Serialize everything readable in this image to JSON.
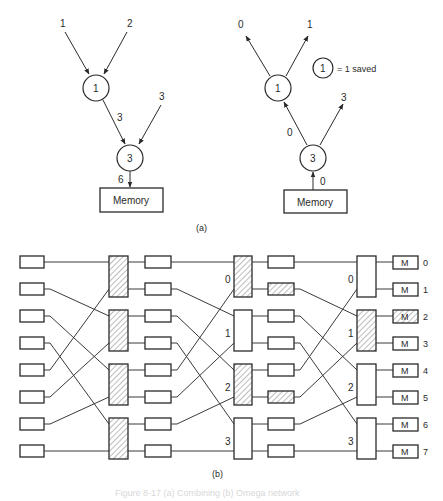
{
  "figure": {
    "part_a": {
      "label": "(a)",
      "combining_tree": {
        "inputs": [
          "1",
          "2"
        ],
        "node_upper": "1",
        "edge_upper_to_lower": "3",
        "side_input": "3",
        "node_lower": "3",
        "to_memory": "6",
        "memory_label": "Memory"
      },
      "decombining_tree": {
        "outputs": [
          "0",
          "1"
        ],
        "node_upper": "1",
        "edge_lower_to_upper": "0",
        "side_output": "3",
        "node_lower": "3",
        "from_memory": "0",
        "memory_label": "Memory"
      },
      "legend": {
        "circle_value": "1",
        "text": "= 1 saved"
      }
    },
    "part_b": {
      "label": "(b)",
      "stage_labels": {
        "stage2": [
          "0",
          "1",
          "2",
          "3"
        ],
        "stage3": [
          "0",
          "1",
          "2",
          "3"
        ]
      },
      "memory_modules": [
        {
          "label": "M",
          "index": "0",
          "hatched": false
        },
        {
          "label": "M",
          "index": "1",
          "hatched": false
        },
        {
          "label": "M",
          "index": "2",
          "hatched": true
        },
        {
          "label": "M",
          "index": "3",
          "hatched": false
        },
        {
          "label": "M",
          "index": "4",
          "hatched": false
        },
        {
          "label": "M",
          "index": "5",
          "hatched": false
        },
        {
          "label": "M",
          "index": "6",
          "hatched": false
        },
        {
          "label": "M",
          "index": "7",
          "hatched": false
        }
      ],
      "hatched": {
        "stage1_switches": [
          true,
          true,
          true,
          true
        ],
        "stage2_switches": [
          true,
          false,
          true,
          false
        ],
        "stage3_switches": [
          false,
          true,
          false,
          false
        ],
        "stage2_buffers": [
          false,
          true,
          false,
          false,
          false,
          true,
          false,
          false
        ]
      }
    },
    "caption": "Figure 8-17  (a) Combining (b) Omega network"
  }
}
